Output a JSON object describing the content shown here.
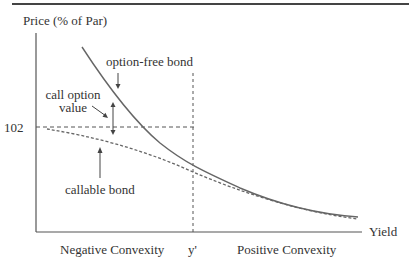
{
  "figure": {
    "y_axis_label": "Price (% of Par)",
    "x_axis_label": "Yield",
    "price_level_label": "102",
    "yield_marker_label": "y'",
    "region_left_label": "Negative Convexity",
    "region_right_label": "Positive Convexity",
    "annotations": {
      "option_free": "option-free bond",
      "call_option_line1": "call option",
      "call_option_line2": "value",
      "callable": "callable bond"
    },
    "colors": {
      "axis": "#555555",
      "curve": "#666666",
      "text": "#333333"
    }
  }
}
